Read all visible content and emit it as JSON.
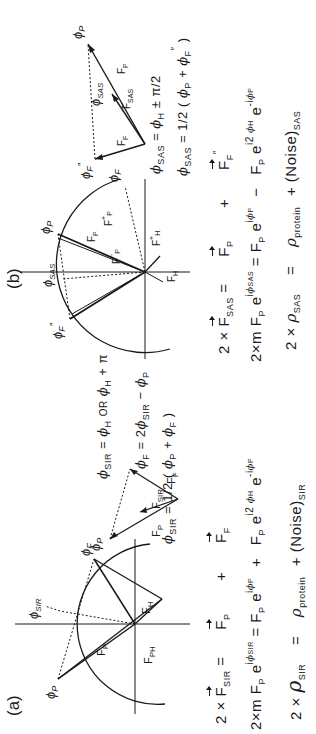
{
  "figure": {
    "orientation": "rotated 90 degrees counter-clockwise",
    "panels": [
      {
        "label": "(a)",
        "method": "SIR",
        "circle_diagram": {
          "labels": [
            "ϕP",
            "ϕSIR",
            "ϕF",
            "FP",
            "FH",
            "FPH"
          ]
        },
        "vector_diagram": {
          "vectors": [
            "FP",
            "FSIR",
            "FF"
          ],
          "point_labels": [
            "ϕP"
          ],
          "relations": [
            "ϕSIR = ϕH OR ϕH + π",
            "ϕF = 2ϕSIR − ϕP"
          ]
        },
        "phase_equation": "ϕSIR = 1/2 (ϕP + ϕF)",
        "equations": [
          {
            "lhs": "2 × FSIR =",
            "t1": "FP",
            "op": "+",
            "t2": "FF"
          },
          {
            "lhs": "2×m FP e^(iϕSIR) =",
            "t1": "FP e^(iϕP)",
            "op": "+",
            "t2": "FP e^(i2ϕH) e^(−iϕP)"
          },
          {
            "lhs": "2 × ρSIR =",
            "t1": "ρprotein",
            "op": "+",
            "t2": "(Noise)SIR"
          }
        ]
      },
      {
        "label": "(b)",
        "method": "SAS",
        "circle_diagram": {
          "labels": [
            "ϕP",
            "ϕSAS",
            "ϕF",
            "ϕ″F",
            "FP",
            "F+P",
            "F+H",
            "FH",
            "F−P"
          ]
        },
        "vector_diagram": {
          "vectors": [
            "FP",
            "FSAS",
            "F″F"
          ],
          "point_labels": [
            "ϕP",
            "ϕSAS",
            "ϕ″F"
          ],
          "relations": [
            "ϕSAS = ϕH ± π/2"
          ]
        },
        "phase_equation": "ϕSAS = 1/2 (ϕP + ϕ″F)",
        "equations": [
          {
            "lhs": "2 × FSAS =",
            "t1": "FP",
            "op": "+",
            "t2": "F″F"
          },
          {
            "lhs": "2×m FP e^(iϕSAS) =",
            "t1": "FP e^(iϕP)",
            "op": "−",
            "t2": "FP e^(i2ϕH) e^(−iϕP)"
          },
          {
            "lhs": "2 × ρSAS =",
            "t1": "ρprotein",
            "op": "+",
            "t2": "(Noise)SAS"
          }
        ]
      }
    ]
  },
  "text": {
    "a_label": "(a)",
    "b_label": "(b)",
    "two_x": "2 ×",
    "two_xm": "2×m",
    "eq": "=",
    "plus": "+",
    "minus": "−",
    "F": "F",
    "e": "e",
    "i": "i",
    "i2": "i2",
    "neg_i": "-i",
    "phi": "ϕ",
    "rho": "ρ",
    "noise": "(Noise)",
    "SIR": "SIR",
    "SAS": "SAS",
    "P": "P",
    "F_sub": "F",
    "H": "H",
    "PH": "PH",
    "protein": "protein",
    "half": "1/2",
    "lparen": "(",
    "rparen": ")",
    "or": "OR",
    "pi": "π",
    "pm": "±",
    "pi_over_2": "π/2",
    "two": "2",
    "dprime": "″",
    "plus_sup": "+",
    "minus_sup": "−"
  }
}
